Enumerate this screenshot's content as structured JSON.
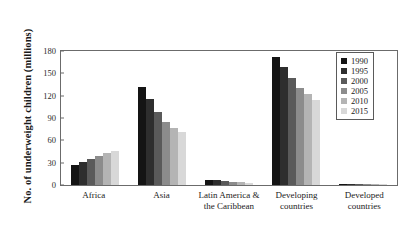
{
  "chart_data": {
    "type": "bar",
    "title": "",
    "xlabel": "",
    "ylabel": "No. of underweight children (millions)",
    "ylim": [
      0,
      180
    ],
    "yticks": [
      0,
      30,
      60,
      90,
      120,
      150,
      180
    ],
    "grid": false,
    "legend_position": "top-right",
    "categories": [
      "Africa",
      "Asia",
      "Latin America &\nthe Caribbean",
      "Developing\ncountries",
      "Developed\ncountries"
    ],
    "category_labels": [
      [
        "Africa"
      ],
      [
        "Asia"
      ],
      [
        "Latin America &",
        "the Caribbean"
      ],
      [
        "Developing",
        "countries"
      ],
      [
        "Developed",
        "countries"
      ]
    ],
    "series": [
      {
        "name": "1990",
        "color": "#141414",
        "values": [
          27,
          130,
          7,
          170,
          2
        ]
      },
      {
        "name": "1995",
        "color": "#2e2e2e",
        "values": [
          31,
          114,
          6,
          156,
          2
        ]
      },
      {
        "name": "2000",
        "color": "#5a5a5a",
        "values": [
          35,
          97,
          5,
          141,
          1.5
        ]
      },
      {
        "name": "2005",
        "color": "#8c8c8c",
        "values": [
          39,
          84,
          4,
          128,
          1.5
        ]
      },
      {
        "name": "2010",
        "color": "#b4b4b4",
        "values": [
          43,
          76,
          3.5,
          120,
          1
        ]
      },
      {
        "name": "2015",
        "color": "#d8d8d8",
        "values": [
          45,
          70,
          3,
          113,
          1
        ]
      }
    ]
  },
  "style": {
    "frame_color": "#6b6b6b",
    "background": "#ffffff",
    "text_color": "#1a1a1a"
  }
}
